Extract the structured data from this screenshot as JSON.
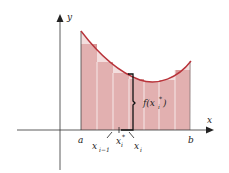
{
  "diagram": {
    "axis_labels": {
      "x": "x",
      "y": "y"
    },
    "interval": {
      "a": "a",
      "b": "b"
    },
    "point_labels": {
      "x_prev": "x",
      "x_prev_sub": "i−1",
      "x_star": "x",
      "x_star_sub": "i",
      "x_star_sup": "*",
      "x_i": "x",
      "x_i_sub": "i"
    },
    "height_label": "f(x",
    "height_label_sub": "i",
    "height_label_sup": "*",
    "height_label_close": ")",
    "colors": {
      "curve": "#b8333a",
      "rect_fill": "#d99a9a",
      "rect_divider": "#f6e8e8",
      "axis": "#333333",
      "brace": "#111111"
    },
    "rectangle_count": 7
  }
}
